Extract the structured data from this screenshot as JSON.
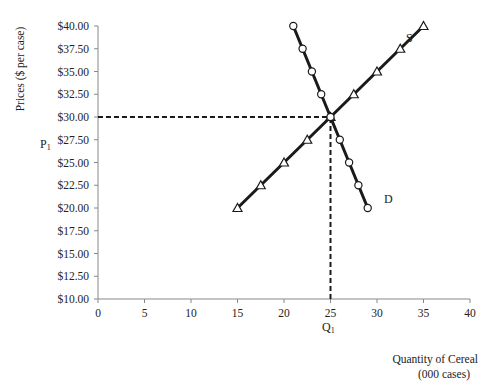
{
  "chart_data": {
    "type": "line",
    "title": "",
    "xlabel": "Quantity of Cereal (000 cases)",
    "xlabel_lines": [
      "Quantity of Cereal",
      "(000 cases)"
    ],
    "ylabel": "Prices ($ per case)",
    "xlim": [
      0,
      40
    ],
    "ylim": [
      10,
      40
    ],
    "x_ticks": [
      0,
      5,
      10,
      15,
      20,
      25,
      30,
      35,
      40
    ],
    "x_tick_labels": [
      "0",
      "5",
      "10",
      "15",
      "20",
      "25",
      "30",
      "35",
      "40"
    ],
    "y_ticks": [
      10,
      12.5,
      15,
      17.5,
      20,
      22.5,
      25,
      27.5,
      30,
      32.5,
      35,
      37.5,
      40
    ],
    "y_tick_labels": [
      "$10.00",
      "$12.50",
      "$15.00",
      "$17.50",
      "$20.00",
      "$22.50",
      "$25.00",
      "$27.50",
      "$30.00",
      "$32.50",
      "$35.00",
      "$37.50",
      "$40.00"
    ],
    "grid": false,
    "legend": "none (curves labeled inline)",
    "series": [
      {
        "name": "S",
        "label": "S",
        "marker": "triangle-open",
        "x": [
          15,
          17.5,
          20,
          22.5,
          25,
          27.5,
          30,
          32.5,
          35
        ],
        "y": [
          20,
          22.5,
          25,
          27.5,
          30,
          32.5,
          35,
          37.5,
          40
        ]
      },
      {
        "name": "D",
        "label": "D",
        "marker": "circle-open",
        "x": [
          21,
          22,
          23,
          24,
          25,
          26,
          27,
          28,
          29
        ],
        "y": [
          40,
          37.5,
          35,
          32.5,
          30,
          27.5,
          25,
          22.5,
          20
        ]
      }
    ],
    "annotations": [
      {
        "type": "equilibrium",
        "x": 25,
        "y": 30
      },
      {
        "type": "dashed-hline",
        "y": 30,
        "from_x": 0,
        "to_x": 25,
        "label": "P1"
      },
      {
        "type": "dashed-vline",
        "x": 25,
        "from_y": 10,
        "to_y": 30,
        "label": "Q1"
      }
    ]
  },
  "labels": {
    "p1_main": "P",
    "p1_sub": "1",
    "q1_main": "Q",
    "q1_sub": "1",
    "s_label": "S",
    "d_label": "D"
  },
  "style": {
    "line_color": "#1a1a1a",
    "axis_color": "#888888",
    "text_color": "#222222"
  }
}
